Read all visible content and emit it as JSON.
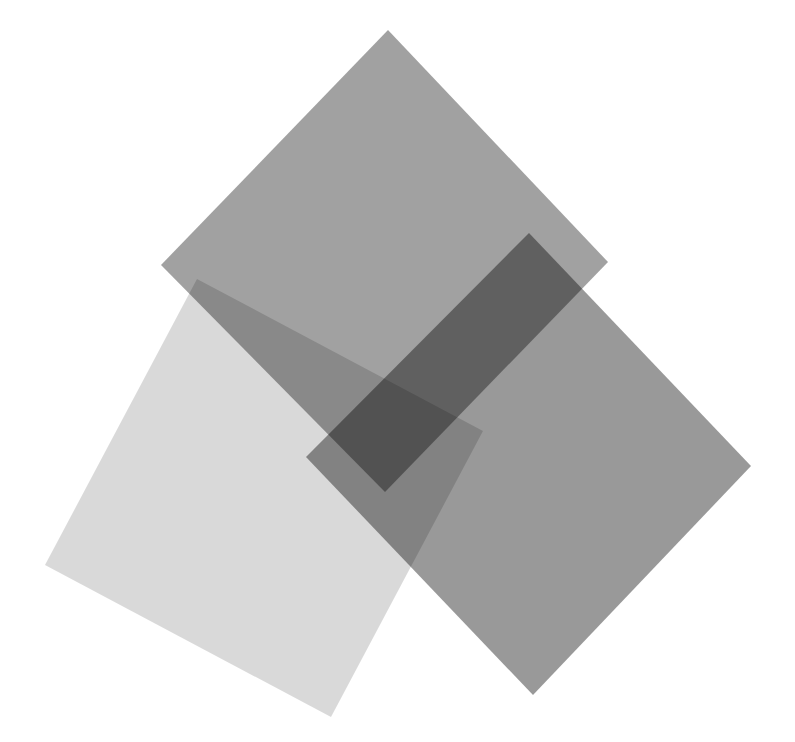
{
  "diagram": {
    "background": "#ffffff",
    "shapes": [
      {
        "id": "square-light",
        "points": "197,279 483,431 331,717 45,565",
        "fill": "#000000",
        "opacity": 0.15
      },
      {
        "id": "square-top",
        "points": "388,30 608,262 385,492 161,265",
        "fill": "#000000",
        "opacity": 0.37
      },
      {
        "id": "square-right",
        "points": "529,233 751,466 533,695 306,457",
        "fill": "#000000",
        "opacity": 0.4
      }
    ]
  }
}
